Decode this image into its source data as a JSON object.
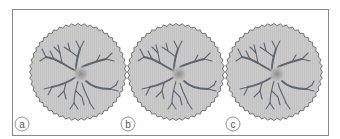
{
  "figure": {
    "panels": [
      {
        "label": "a",
        "description": "neuron cell in serrated circular dish"
      },
      {
        "label": "b",
        "description": "neuron cell in serrated circular dish"
      },
      {
        "label": "c",
        "description": "neuron cell in serrated circular dish"
      }
    ],
    "colors": {
      "dish_fill": "#c9c9c9",
      "dish_edge": "#5a5a5a",
      "dendrite": "#5f6670",
      "nucleus": "#9a9a9a",
      "frame": "#8a8a8a",
      "label_ring": "#777777"
    }
  }
}
